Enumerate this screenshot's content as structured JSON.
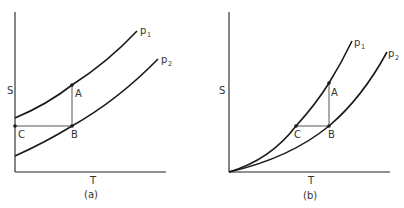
{
  "figure": {
    "panels": [
      {
        "id": "a",
        "caption": "(a)",
        "y_axis_label": "S",
        "x_axis_label": "T",
        "curves": [
          {
            "name": "p",
            "subscript": "1"
          },
          {
            "name": "p",
            "subscript": "2"
          }
        ],
        "points": [
          "A",
          "B",
          "C"
        ]
      },
      {
        "id": "b",
        "caption": "(b)",
        "y_axis_label": "S",
        "x_axis_label": "T",
        "curves": [
          {
            "name": "p",
            "subscript": "1"
          },
          {
            "name": "p",
            "subscript": "2"
          }
        ],
        "points": [
          "A",
          "B",
          "C"
        ]
      }
    ]
  },
  "colors": {
    "background": "#ffffff",
    "line": "#1a1a1a",
    "text": "#333333"
  }
}
